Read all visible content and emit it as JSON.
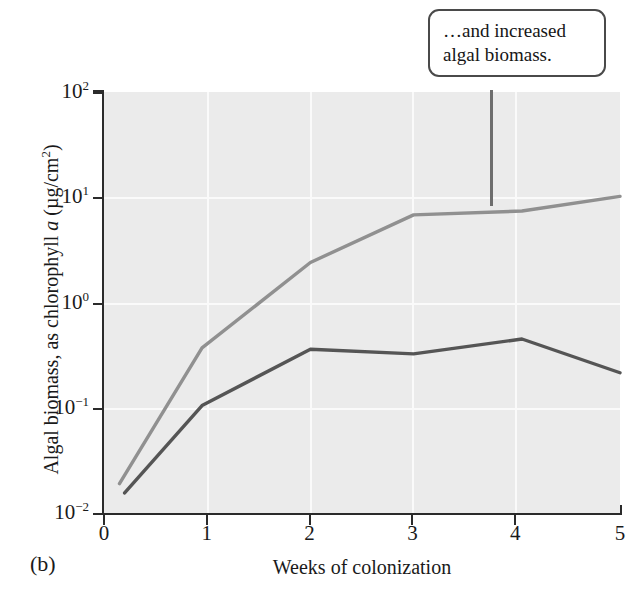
{
  "figure": {
    "panel_label": "(b)",
    "callout": {
      "line1": "…and increased",
      "line2": "algal biomass."
    }
  },
  "chart_data": {
    "type": "line",
    "title": "",
    "xlabel": "Weeks of colonization",
    "ylabel": "Algal biomass, as chlorophyll a (µg/cm²)",
    "ylabel_parts": {
      "pre": "Algal biomass, as chlorophyll ",
      "italic": "a",
      "post_open": " (µg/cm",
      "sup": "2",
      "post_close": ")"
    },
    "xlim": [
      0,
      5
    ],
    "ylim": [
      0.01,
      100
    ],
    "yscale": "log",
    "grid": true,
    "legend": "none",
    "xticks": [
      "0",
      "1",
      "2",
      "3",
      "4",
      "5"
    ],
    "xtick_values": [
      0,
      1,
      2,
      3,
      4,
      5
    ],
    "yticks": [
      {
        "mantissa": "10",
        "exponent": "2",
        "value": 100
      },
      {
        "mantissa": "10",
        "exponent": "1",
        "value": 10
      },
      {
        "mantissa": "10",
        "exponent": "0",
        "value": 1
      },
      {
        "mantissa": "10",
        "exponent": "−1",
        "value": 0.1
      },
      {
        "mantissa": "10",
        "exponent": "−2",
        "value": 0.01
      }
    ],
    "series": [
      {
        "name": "upper-curve",
        "color": "#909090",
        "x": [
          0.15,
          0.95,
          2.0,
          3.0,
          4.05,
          5.0
        ],
        "values": [
          0.019,
          0.37,
          2.4,
          6.8,
          7.4,
          10.2
        ]
      },
      {
        "name": "lower-curve",
        "color": "#555555",
        "x": [
          0.2,
          0.95,
          2.0,
          3.0,
          4.05,
          5.0
        ],
        "values": [
          0.0155,
          0.105,
          0.36,
          0.325,
          0.45,
          0.215
        ]
      }
    ]
  },
  "colors": {
    "plot_background": "#ebebeb",
    "gridline": "#fafafa",
    "axis": "#2b2b2b",
    "callout_border": "#4a4a4a",
    "callout_stem": "#6e6e6e"
  }
}
